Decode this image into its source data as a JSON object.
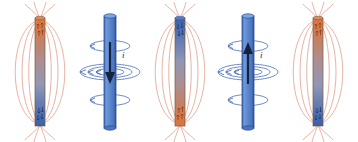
{
  "figure": {
    "background_color": "#ffffff",
    "width": 358,
    "height": 142
  },
  "colors": {
    "north_pole": "#d9763f",
    "south_pole": "#3c5fa8",
    "magnet_mid": "#9b93a8",
    "magnet_outline": "#7a5a46",
    "field_line": "#e2a08a",
    "solenoid_body": "#5b87cc",
    "solenoid_edge": "#2f4f8f",
    "solenoid_cap": "#6f9bd8",
    "current_loop": "#4a71b8",
    "axis_arrow": "#16233f",
    "label_color": "#1b2a4a"
  },
  "panels": [
    {
      "index": 1,
      "kind": "bar-magnet",
      "name": "bar-magnet-north-up",
      "center_x": 40,
      "top_pole": "north",
      "bottom_pole": "south",
      "top_pole_color": "#d9763f",
      "bottom_pole_color": "#3c5fa8",
      "field_lines": true,
      "field_loop_count": 3,
      "pole_marking": "arrows",
      "current_label": ""
    },
    {
      "index": 2,
      "kind": "solenoid",
      "name": "solenoid-current-down",
      "center_x": 110,
      "axis_arrow_direction": "down",
      "loop_count": 3,
      "loop_arrow_side": "left",
      "current_label": "i",
      "field_lines": false
    },
    {
      "index": 3,
      "kind": "bar-magnet",
      "name": "bar-magnet-south-up",
      "center_x": 180,
      "top_pole": "south",
      "bottom_pole": "north",
      "top_pole_color": "#3c5fa8",
      "bottom_pole_color": "#d9763f",
      "field_lines": true,
      "field_loop_count": 3,
      "pole_marking": "arrows",
      "current_label": ""
    },
    {
      "index": 4,
      "kind": "solenoid",
      "name": "solenoid-current-up",
      "center_x": 248,
      "axis_arrow_direction": "up",
      "loop_count": 3,
      "loop_arrow_side": "left",
      "current_label": "i",
      "field_lines": false
    },
    {
      "index": 5,
      "kind": "bar-magnet",
      "name": "bar-magnet-north-up-2",
      "center_x": 318,
      "top_pole": "north",
      "bottom_pole": "south",
      "top_pole_color": "#d9763f",
      "bottom_pole_color": "#3c5fa8",
      "field_lines": true,
      "field_loop_count": 3,
      "pole_marking": "arrows",
      "current_label": ""
    }
  ],
  "geometry": {
    "magnet_top_y": 18,
    "magnet_bottom_y": 126,
    "magnet_half_width": 5,
    "solenoid_top_y": 16,
    "solenoid_bottom_y": 128,
    "solenoid_half_width": 6,
    "loop_y_positions": [
      46,
      72,
      100
    ],
    "loop_radii_x": [
      30,
      22,
      14
    ],
    "field_loop_radii_x": [
      33,
      24,
      15
    ]
  }
}
